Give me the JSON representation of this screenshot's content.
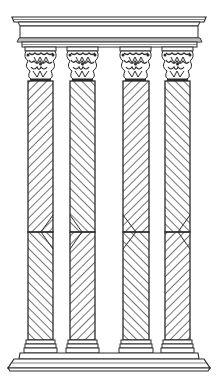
{
  "image": {
    "subject": "Four Corinthian columns with spiral-fluted shafts on a common base under an entablature",
    "line_color": "#2a2a2a",
    "background": "#ffffff"
  },
  "entablature": {
    "top": 15,
    "bottom": 48,
    "left": 12,
    "right": 206
  },
  "columns": [
    {
      "x": 28,
      "width": 25
    },
    {
      "x": 70,
      "width": 25
    },
    {
      "x": 123,
      "width": 26
    },
    {
      "x": 165,
      "width": 25
    }
  ],
  "shaft": {
    "top": 80,
    "bottom": 340,
    "chevron_y": 232
  },
  "base": {
    "top": 340,
    "bottom": 370,
    "left": 8,
    "right": 212
  }
}
